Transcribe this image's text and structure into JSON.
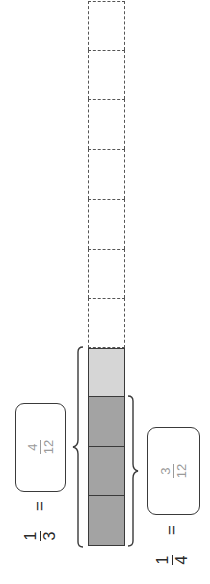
{
  "diagram": {
    "strip": {
      "total_cells": 12,
      "cells": [
        {
          "index": 1,
          "style": "dashed-empty"
        },
        {
          "index": 2,
          "style": "dashed-empty"
        },
        {
          "index": 3,
          "style": "dashed-empty"
        },
        {
          "index": 4,
          "style": "dashed-empty"
        },
        {
          "index": 5,
          "style": "dashed-empty"
        },
        {
          "index": 6,
          "style": "dashed-empty"
        },
        {
          "index": 7,
          "style": "dashed-empty"
        },
        {
          "index": 8,
          "style": "dashed-empty"
        },
        {
          "index": 9,
          "style": "shaded-light"
        },
        {
          "index": 10,
          "style": "shaded-dark"
        },
        {
          "index": 11,
          "style": "shaded-dark"
        },
        {
          "index": 12,
          "style": "shaded-dark"
        }
      ],
      "colors": {
        "light": "#d6d6d6",
        "dark": "#a3a3a3",
        "border": "#3a3a3a"
      }
    },
    "left_equation": {
      "fraction": {
        "numerator": "1",
        "denominator": "3"
      },
      "equals": "=",
      "answer": {
        "numerator": "4",
        "denominator": "12"
      },
      "brace_spans_cells": 4
    },
    "right_equation": {
      "fraction": {
        "numerator": "1",
        "denominator": "4"
      },
      "equals": "=",
      "answer": {
        "numerator": "3",
        "denominator": "12"
      },
      "brace_spans_cells": 3
    },
    "answer_color": "#9a9a9a"
  }
}
